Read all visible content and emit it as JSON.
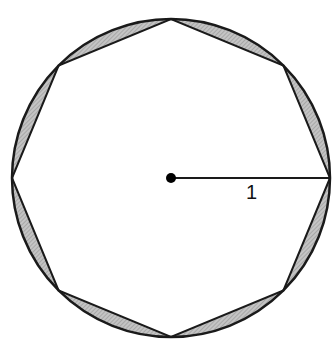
{
  "diagram": {
    "circle": {
      "cx": 171,
      "cy": 178,
      "r": 159,
      "stroke": "#1a1a1a"
    },
    "polygon": {
      "sides": 8,
      "vertex_start_angle_deg": 0
    },
    "shading": {
      "fill": "#b5b5b5"
    },
    "radius_label": "1",
    "center_point": {
      "x": 171,
      "y": 178
    }
  }
}
